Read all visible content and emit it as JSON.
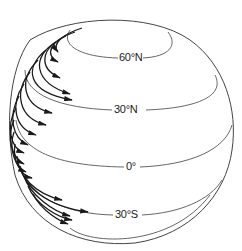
{
  "diagram": {
    "labels": {
      "lat_60n": "60°N",
      "lat_30n": "30°N",
      "lat_0": "0°",
      "lat_30s": "30°S"
    },
    "colors": {
      "outline": "#444444",
      "latitude": "#555555",
      "arrows": "#1a1a1a",
      "background": "#ffffff"
    }
  }
}
